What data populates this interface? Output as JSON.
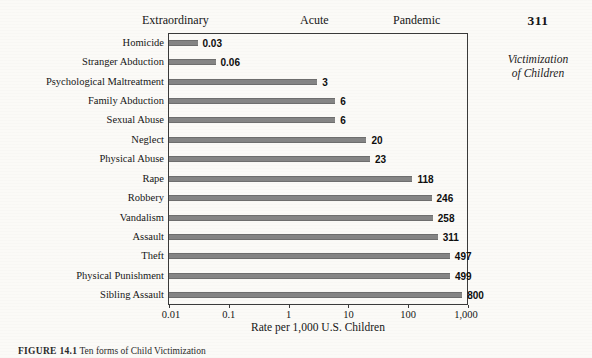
{
  "page": {
    "folio": "311",
    "running_head_line1": "Victimization",
    "running_head_line2": "of Children"
  },
  "bands": [
    {
      "label": "Extraordinary"
    },
    {
      "label": "Acute"
    },
    {
      "label": "Pandemic"
    }
  ],
  "caption": {
    "tag": "FIGURE 14.1",
    "text": "Ten forms of Child Victimization"
  },
  "colors": {
    "bar_fill": "#858585",
    "bar_edge": "#6e6e6e",
    "frame": "#3a3a3a",
    "page_background": "#fbfaf7",
    "text": "#161616"
  },
  "chart_data": {
    "type": "bar",
    "orientation": "horizontal",
    "title": "",
    "subtitle": "",
    "xlabel": "Rate per 1,000 U.S. Children",
    "ylabel": "",
    "xscale": "log",
    "xlim": [
      0.01,
      1000
    ],
    "xticks": [
      0.01,
      0.1,
      1,
      10,
      100,
      1000
    ],
    "xticklabels": [
      "0.01",
      "0.1",
      "1",
      "10",
      "100",
      "1,000"
    ],
    "grid": false,
    "legend": null,
    "annotations": [
      "Extraordinary",
      "Acute",
      "Pandemic"
    ],
    "categories": [
      "Homicide",
      "Stranger Abduction",
      "Psychological Maltreatment",
      "Family Abduction",
      "Sexual Abuse",
      "Neglect",
      "Physical Abuse",
      "Rape",
      "Robbery",
      "Vandalism",
      "Assault",
      "Theft",
      "Physical Punishment",
      "Sibling Assault"
    ],
    "values": [
      0.03,
      0.06,
      3,
      6,
      6,
      20,
      23,
      118,
      246,
      258,
      311,
      497,
      499,
      800
    ],
    "value_labels": [
      "0.03",
      "0.06",
      "3",
      "6",
      "6",
      "20",
      "23",
      "118",
      "246",
      "258",
      "311",
      "497",
      "499",
      "800"
    ]
  }
}
